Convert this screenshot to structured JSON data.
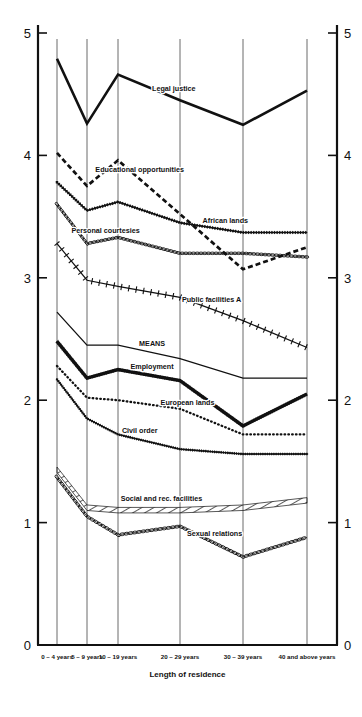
{
  "chart_data": {
    "type": "line",
    "title": "",
    "xlabel": "Length of residence",
    "ylabel": "",
    "ylim": [
      0,
      5
    ],
    "xlim": [
      0,
      5
    ],
    "grid": true,
    "legend": "inline-labels",
    "y_ticks": [
      "0",
      "1",
      "2",
      "3",
      "4",
      "5"
    ],
    "y_axis_both_sides": true,
    "categories": [
      "0 – 4 years",
      "5 – 9 years",
      "10 – 19 years",
      "20 – 29 years",
      "30 – 39 years",
      "40 and above years"
    ],
    "series": [
      {
        "name": "Legal justice",
        "style": "thick-solid",
        "label_x_index": 2.9,
        "values": [
          4.79,
          4.26,
          4.66,
          4.45,
          4.25,
          4.53
        ]
      },
      {
        "name": "Educational opportunities",
        "style": "thick-dashed",
        "label_x_index": 2.35,
        "values": [
          4.02,
          3.75,
          3.96,
          3.52,
          3.07,
          3.25
        ]
      },
      {
        "name": "African lands",
        "style": "beaded",
        "label_x_index": 3.72,
        "values": [
          3.78,
          3.55,
          3.62,
          3.45,
          3.37,
          3.37
        ]
      },
      {
        "name": "Personal courtesies",
        "style": "chain-oval",
        "label_x_index": 1.6,
        "values": [
          3.6,
          3.28,
          3.33,
          3.2,
          3.2,
          3.17
        ]
      },
      {
        "name": "Public facilities A",
        "style": "ticked",
        "label_x_index": 3.5,
        "values": [
          3.28,
          2.98,
          2.93,
          2.84,
          2.65,
          2.43
        ]
      },
      {
        "name": "MEANS",
        "style": "thin-solid",
        "label_x_index": 2.55,
        "values": [
          2.72,
          2.45,
          2.45,
          2.34,
          2.18,
          2.18
        ]
      },
      {
        "name": "Employment",
        "style": "double-rail",
        "label_x_index": 2.55,
        "values": [
          2.48,
          2.18,
          2.25,
          2.16,
          1.79,
          2.05
        ]
      },
      {
        "name": "European lands",
        "style": "dotted",
        "label_x_index": 3.12,
        "values": [
          2.28,
          2.02,
          2.0,
          1.93,
          1.72,
          1.72
        ]
      },
      {
        "name": "Civil order",
        "style": "beaded-fine",
        "label_x_index": 2.35,
        "values": [
          2.17,
          1.85,
          1.72,
          1.6,
          1.56,
          1.56
        ]
      },
      {
        "name": "Social and rec. facilities",
        "style": "hatched-band",
        "label_x_index": 2.7,
        "values": [
          1.45,
          1.14,
          1.12,
          1.12,
          1.14,
          1.2
        ]
      },
      {
        "name": "Sexual relations",
        "style": "chain-oval-open",
        "label_x_index": 3.55,
        "values": [
          1.37,
          1.05,
          0.9,
          0.97,
          0.72,
          0.88
        ]
      }
    ]
  },
  "axis": {
    "left_labels": [
      "5",
      "4",
      "3",
      "2",
      "1",
      "0"
    ],
    "right_labels": [
      "5",
      "4",
      "3",
      "2",
      "1",
      "0"
    ],
    "x_title": "Length of residence"
  }
}
